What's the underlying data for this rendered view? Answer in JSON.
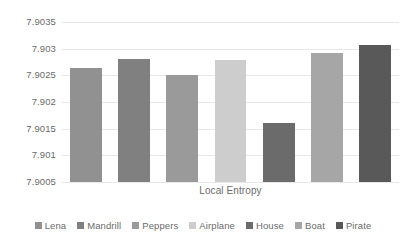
{
  "chart_data": {
    "type": "bar",
    "title": "",
    "xlabel": "Local Entropy",
    "ylabel": "",
    "categories": [
      "Lena",
      "Mandrill",
      "Peppers",
      "Airplane",
      "House",
      "Boat",
      "Pirate"
    ],
    "values": [
      7.90263,
      7.9028,
      7.9025,
      7.90278,
      7.90161,
      7.90292,
      7.90307
    ],
    "colors": [
      "#919191",
      "#808080",
      "#9a9a9a",
      "#cdcdcd",
      "#6b6b6b",
      "#a6a6a6",
      "#595959"
    ],
    "ylim": [
      7.9005,
      7.9035
    ],
    "ytick_labels": [
      "7.9035",
      "7.903",
      "7.9025",
      "7.902",
      "7.9015",
      "7.901",
      "7.9005"
    ],
    "ytick_values": [
      7.9035,
      7.903,
      7.9025,
      7.902,
      7.9015,
      7.901,
      7.9005
    ],
    "grid": true,
    "legend_position": "bottom",
    "legend_entries": [
      "Lena",
      "Mandrill",
      "Peppers",
      "Airplane",
      "House",
      "Boat",
      "Pirate"
    ],
    "axis_label_color": "#6b6b6b",
    "grid_color": "#e8e8e8",
    "background": "#ffffff"
  }
}
